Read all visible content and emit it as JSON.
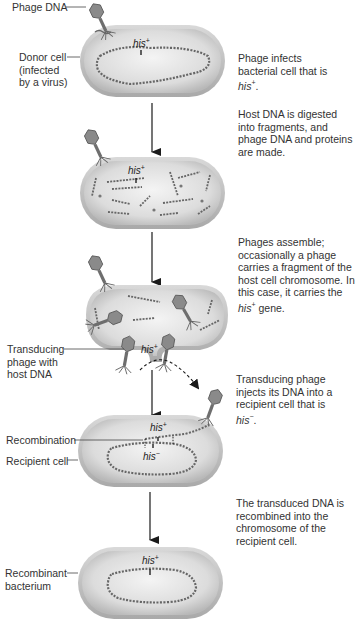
{
  "figure": {
    "gene_label": "his",
    "gene_plus": "+",
    "gene_minus": "−"
  },
  "left_labels": {
    "phage_dna": "Phage DNA",
    "donor_cell": "Donor cell\n(infected\nby a virus)",
    "transducing_phage": "Transducing\nphage with\nhost DNA",
    "recombination": "Recombination",
    "recipient_cell": "Recipient cell",
    "recombinant": "Recombinant\nbacterium"
  },
  "steps": [
    {
      "pre": "Phage infects bacterial cell that is ",
      "gene": "his",
      "sup": "+",
      "post": "."
    },
    {
      "pre": "Host DNA is digested into fragments, and phage DNA and proteins are made.",
      "gene": "",
      "sup": "",
      "post": ""
    },
    {
      "pre": "Phages assemble; occasionally a phage carries a fragment of the host cell chromosome. In this case, it carries the ",
      "gene": "his",
      "sup": "+",
      "post": " gene."
    },
    {
      "pre": "Transducing phage injects its DNA into a recipient cell that is ",
      "gene": "his",
      "sup": "−",
      "post": "."
    },
    {
      "pre": "The transduced DNA is recombined into the chromosome of the recipient cell.",
      "gene": "",
      "sup": "",
      "post": ""
    }
  ],
  "colors": {
    "cell_outer": "#c9c9c9",
    "cell_inner": "#e6e6e6",
    "dna": "#6a6a6a",
    "phage": "#7a7a7a",
    "arrow": "#1a1a1a",
    "text": "#333333"
  }
}
